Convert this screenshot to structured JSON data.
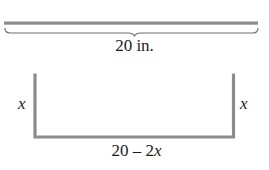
{
  "diagram": {
    "title": "",
    "colors": {
      "bar": "#8c8c8c",
      "brace": "#6f6f6f",
      "text": "#1a1a1a"
    },
    "top_section": {
      "description": "Flat strip of material",
      "length_label": "20 in."
    },
    "bottom_section": {
      "description": "Strip folded into a U-shaped channel",
      "left_side_label": "x",
      "right_side_label": "x",
      "base_label_number": "20 – 2",
      "base_label_variable": "x"
    }
  }
}
